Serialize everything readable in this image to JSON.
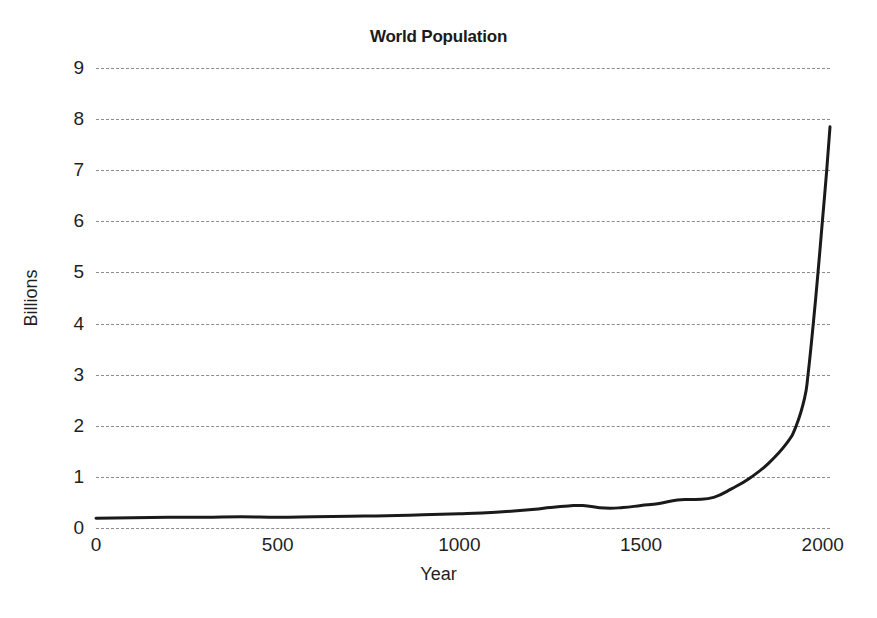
{
  "chart_data": {
    "type": "line",
    "title": "World Population",
    "xlabel": "Year",
    "ylabel": "Billions",
    "xlim": [
      0,
      2020
    ],
    "ylim": [
      0,
      9
    ],
    "xticks": [
      0,
      500,
      1000,
      1500,
      2000
    ],
    "xticklabels": [
      "0",
      "500",
      "1000",
      "1500",
      "2000"
    ],
    "yticks": [
      0,
      1,
      2,
      3,
      4,
      5,
      6,
      7,
      8,
      9
    ],
    "yticklabels": [
      "0",
      "1",
      "2",
      "3",
      "4",
      "5",
      "6",
      "7",
      "8",
      "9"
    ],
    "grid": "horizontal-dashed",
    "legend": "none",
    "series": [
      {
        "name": "World Population",
        "color": "#1a1a1a",
        "linewidth": 3,
        "x": [
          0,
          100,
          200,
          300,
          400,
          500,
          600,
          700,
          800,
          900,
          1000,
          1100,
          1200,
          1250,
          1300,
          1340,
          1400,
          1450,
          1500,
          1550,
          1600,
          1650,
          1700,
          1750,
          1800,
          1850,
          1900,
          1927,
          1950,
          1960,
          1974,
          1987,
          1999,
          2011,
          2020
        ],
        "values": [
          0.19,
          0.2,
          0.21,
          0.21,
          0.22,
          0.21,
          0.22,
          0.23,
          0.24,
          0.26,
          0.28,
          0.31,
          0.36,
          0.4,
          0.43,
          0.44,
          0.39,
          0.4,
          0.44,
          0.48,
          0.55,
          0.56,
          0.6,
          0.77,
          0.98,
          1.26,
          1.65,
          2.0,
          2.54,
          3.03,
          4.0,
          5.0,
          6.0,
          7.0,
          7.85
        ]
      }
    ]
  },
  "axis": {
    "title": "World Population",
    "x_title": "Year",
    "y_title": "Billions"
  }
}
